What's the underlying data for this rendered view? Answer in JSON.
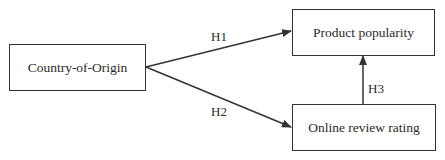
{
  "nodes": [
    {
      "id": "country_of_origin",
      "label": "Country-of-Origin"
    },
    {
      "id": "product_popularity",
      "label": "Product popularity"
    },
    {
      "id": "online_review_rating",
      "label": "Online review rating"
    }
  ],
  "edges": [
    {
      "from": "country_of_origin",
      "to": "product_popularity",
      "label": "H1"
    },
    {
      "from": "country_of_origin",
      "to": "online_review_rating",
      "label": "H2"
    },
    {
      "from": "online_review_rating",
      "to": "product_popularity",
      "label": "H3"
    }
  ],
  "colors": {
    "stroke": "#333333",
    "background": "#ffffff"
  }
}
